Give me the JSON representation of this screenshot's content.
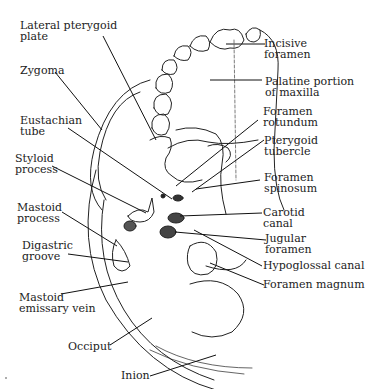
{
  "diagram": {
    "labels": {
      "lateral_pterygoid_plate": [
        "Lateral pterygoid",
        "plate"
      ],
      "zygoma": [
        "Zygoma"
      ],
      "eustachian_tube": [
        "Eustachian",
        "tube"
      ],
      "styloid_process": [
        "Styloid",
        "process"
      ],
      "mastoid_process": [
        "Mastoid",
        "process"
      ],
      "digastric_groove": [
        "Digastric",
        "groove"
      ],
      "mastoid_emissary_vein": [
        "Mastoid",
        "emissary vein"
      ],
      "occiput": [
        "Occiput"
      ],
      "inion": [
        "Inion"
      ],
      "incisive_foramen": [
        "Incisive",
        "foramen"
      ],
      "palatine_portion_of_maxilla": [
        "Palatine portion",
        "of maxilla"
      ],
      "foramen_rotundum": [
        "Foramen",
        "rotundum"
      ],
      "pterygoid_tubercle": [
        "Pterygoid",
        "tubercle"
      ],
      "foramen_spinosum": [
        "Foramen",
        "spinosum"
      ],
      "carotid_canal": [
        "Carotid",
        "canal"
      ],
      "jugular_foramen": [
        "Jugular",
        "foramen"
      ],
      "hypoglossal_canal": [
        "Hypoglossal canal"
      ],
      "foramen_magnum": [
        "Foramen magnum"
      ]
    }
  }
}
